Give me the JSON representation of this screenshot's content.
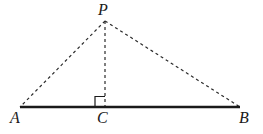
{
  "diagram": {
    "background_color": "#ffffff",
    "stroke_color": "#1a1a1a",
    "dash_color": "#2b2b2b",
    "canvas": {
      "width": 263,
      "height": 134
    },
    "labels": {
      "apex": "P",
      "left_base": "A",
      "foot": "C",
      "right_base": "B"
    },
    "points": {
      "P": {
        "x": 105,
        "y": 21
      },
      "A": {
        "x": 20,
        "y": 107
      },
      "C": {
        "x": 105,
        "y": 107
      },
      "B": {
        "x": 240,
        "y": 107
      }
    },
    "segments": [
      {
        "name": "base-AB",
        "from": "A",
        "to": "B",
        "style": "solid",
        "width": 2.4
      },
      {
        "name": "side-PA",
        "from": "P",
        "to": "A",
        "style": "dashed",
        "width": 1.2
      },
      {
        "name": "side-PB",
        "from": "P",
        "to": "B",
        "style": "dashed",
        "width": 1.2
      },
      {
        "name": "altitude-PC",
        "from": "P",
        "to": "C",
        "style": "dashed",
        "width": 1.2
      }
    ],
    "right_angle": {
      "at": "C",
      "size": 10,
      "orientation": "left-of-altitude",
      "style": "solid",
      "width": 1.2
    },
    "dash_pattern": "3 3"
  }
}
